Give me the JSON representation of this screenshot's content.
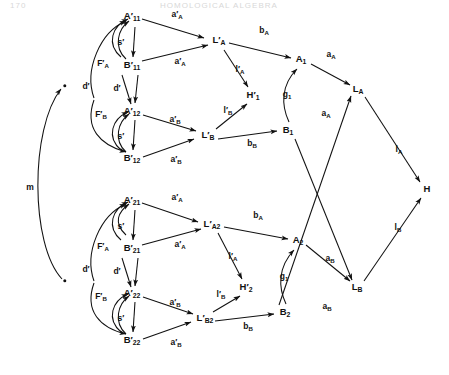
{
  "header": {
    "folio": "170",
    "running_title": "HOMOLOGICAL ALGEBRA"
  },
  "figure": {
    "caption": "",
    "nodes": [
      {
        "id": "dot_top",
        "label": "•",
        "x": 65,
        "y": 86,
        "kind": "point"
      },
      {
        "id": "dot_bot",
        "label": "•",
        "x": 65,
        "y": 281,
        "kind": "point"
      },
      {
        "id": "Ap11",
        "label": "A'11",
        "x": 132,
        "y": 17,
        "kind": "object"
      },
      {
        "id": "Bp11",
        "label": "B'11",
        "x": 132,
        "y": 66,
        "kind": "object"
      },
      {
        "id": "Ap12",
        "label": "A'12",
        "x": 132,
        "y": 112,
        "kind": "object"
      },
      {
        "id": "Bp12",
        "label": "B'12",
        "x": 132,
        "y": 159,
        "kind": "object"
      },
      {
        "id": "LpA1",
        "label": "L'A",
        "x": 219,
        "y": 41,
        "kind": "object"
      },
      {
        "id": "LpB1",
        "label": "L'B",
        "x": 208,
        "y": 136,
        "kind": "object"
      },
      {
        "id": "Hp1",
        "label": "H'1",
        "x": 253,
        "y": 96,
        "kind": "object"
      },
      {
        "id": "A1",
        "label": "A1",
        "x": 301,
        "y": 60,
        "kind": "object"
      },
      {
        "id": "B1",
        "label": "B1",
        "x": 288,
        "y": 131,
        "kind": "object"
      },
      {
        "id": "Ap21",
        "label": "A'21",
        "x": 132,
        "y": 201,
        "kind": "object"
      },
      {
        "id": "Bp21",
        "label": "B'21",
        "x": 132,
        "y": 249,
        "kind": "object"
      },
      {
        "id": "Ap22",
        "label": "A'22",
        "x": 132,
        "y": 294,
        "kind": "object"
      },
      {
        "id": "Bp22",
        "label": "B'22",
        "x": 132,
        "y": 341,
        "kind": "object"
      },
      {
        "id": "LpA2",
        "label": "L'A2",
        "x": 212,
        "y": 225,
        "kind": "object"
      },
      {
        "id": "LpB2",
        "label": "L'B2",
        "x": 205,
        "y": 319,
        "kind": "object"
      },
      {
        "id": "Hp2",
        "label": "H'2",
        "x": 246,
        "y": 288,
        "kind": "object"
      },
      {
        "id": "A2",
        "label": "A2",
        "x": 298,
        "y": 241,
        "kind": "object"
      },
      {
        "id": "B2",
        "label": "B2",
        "x": 285,
        "y": 313,
        "kind": "object"
      },
      {
        "id": "LA",
        "label": "LA",
        "x": 358,
        "y": 90,
        "kind": "object"
      },
      {
        "id": "LB",
        "label": "LB",
        "x": 357,
        "y": 288,
        "kind": "object"
      },
      {
        "id": "H",
        "label": "H",
        "x": 427,
        "y": 189,
        "kind": "object"
      }
    ],
    "edge_labels": [
      {
        "id": "l_m",
        "label": "m",
        "x": 30,
        "y": 187
      },
      {
        "id": "l_aA_t1",
        "label": "a'A",
        "x": 177,
        "y": 15
      },
      {
        "id": "l_aA_t2",
        "label": "a'A",
        "x": 180,
        "y": 62
      },
      {
        "id": "l_aB_t1",
        "label": "a'B",
        "x": 175,
        "y": 120
      },
      {
        "id": "l_aB_t2",
        "label": "a'B",
        "x": 176,
        "y": 160
      },
      {
        "id": "l_sp_t1",
        "label": "s'",
        "x": 121,
        "y": 42
      },
      {
        "id": "l_sp_t2",
        "label": "s'",
        "x": 121,
        "y": 136
      },
      {
        "id": "l_dp_t1",
        "label": "d'",
        "x": 86,
        "y": 86
      },
      {
        "id": "l_dp_t2",
        "label": "d'",
        "x": 117,
        "y": 88
      },
      {
        "id": "l_FA_t",
        "label": "F'A",
        "x": 103,
        "y": 64
      },
      {
        "id": "l_FB_t",
        "label": "F'B",
        "x": 101,
        "y": 115
      },
      {
        "id": "l_bA_t",
        "label": "bA",
        "x": 264,
        "y": 31
      },
      {
        "id": "l_bB_t",
        "label": "bB",
        "x": 252,
        "y": 144
      },
      {
        "id": "l_lA_t",
        "label": "l'A",
        "x": 240,
        "y": 70
      },
      {
        "id": "l_lB_t",
        "label": "l'B",
        "x": 228,
        "y": 111
      },
      {
        "id": "l_g1_t",
        "label": "g1",
        "x": 287,
        "y": 95
      },
      {
        "id": "l_aA_r1",
        "label": "aA",
        "x": 331,
        "y": 55
      },
      {
        "id": "l_aA_r2",
        "label": "aA",
        "x": 326,
        "y": 114
      },
      {
        "id": "l_aA_b1",
        "label": "a'A",
        "x": 177,
        "y": 198
      },
      {
        "id": "l_aA_b2",
        "label": "a'A",
        "x": 180,
        "y": 245
      },
      {
        "id": "l_aB_b1",
        "label": "a'B",
        "x": 175,
        "y": 303
      },
      {
        "id": "l_aB_b2",
        "label": "a'B",
        "x": 176,
        "y": 343
      },
      {
        "id": "l_sp_b1",
        "label": "s'",
        "x": 121,
        "y": 226
      },
      {
        "id": "l_sp_b2",
        "label": "s'",
        "x": 121,
        "y": 318
      },
      {
        "id": "l_dp_b1",
        "label": "d'",
        "x": 86,
        "y": 269
      },
      {
        "id": "l_dp_b2",
        "label": "d'",
        "x": 117,
        "y": 271
      },
      {
        "id": "l_FA_b",
        "label": "F'A",
        "x": 103,
        "y": 247
      },
      {
        "id": "l_FB_b",
        "label": "F'B",
        "x": 101,
        "y": 297
      },
      {
        "id": "l_bA_b",
        "label": "bA",
        "x": 258,
        "y": 216
      },
      {
        "id": "l_bB_b",
        "label": "bB",
        "x": 248,
        "y": 327
      },
      {
        "id": "l_lA_b",
        "label": "l'A",
        "x": 233,
        "y": 257
      },
      {
        "id": "l_lB_b",
        "label": "l'B",
        "x": 221,
        "y": 295
      },
      {
        "id": "l_g1_b",
        "label": "g1",
        "x": 284,
        "y": 277
      },
      {
        "id": "l_aB_r1",
        "label": "aB",
        "x": 330,
        "y": 259
      },
      {
        "id": "l_aB_r2",
        "label": "aB",
        "x": 327,
        "y": 307
      },
      {
        "id": "l_lA_r",
        "label": "lA",
        "x": 399,
        "y": 150
      },
      {
        "id": "l_lB_r",
        "label": "lB",
        "x": 398,
        "y": 228
      }
    ]
  }
}
